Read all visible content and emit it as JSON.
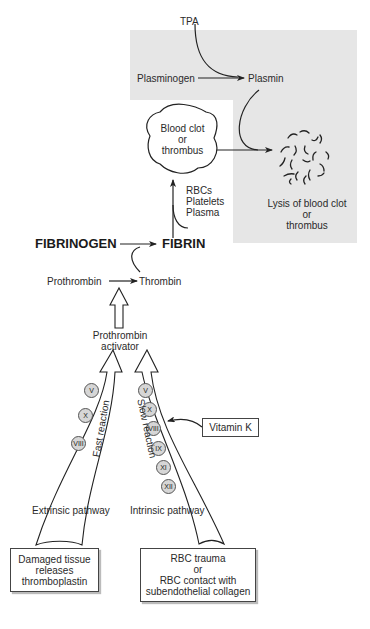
{
  "fibrinolysis": {
    "tpa": "TPA",
    "plasminogen": "Plasminogen",
    "plasmin": "Plasmin",
    "lysis": [
      "Lysis of blood clot",
      "or",
      "thrombus"
    ],
    "background_color": "#e6e6e6"
  },
  "clot": {
    "label": [
      "Blood clot",
      "or",
      "thrombus"
    ],
    "components": [
      "RBCs",
      "Platelets",
      "Plasma"
    ]
  },
  "coagulation": {
    "fibrinogen": "FIBRINOGEN",
    "fibrin": "FIBRIN",
    "prothrombin": "Prothrombin",
    "thrombin": "Thrombin",
    "prothrombin_activator": [
      "Prothrombin",
      "activator"
    ]
  },
  "extrinsic": {
    "reaction_label": "Fast reaction",
    "factors": [
      "V",
      "X",
      "VIII"
    ],
    "pathway_label": "Extrinsic pathway",
    "trigger": [
      "Damaged tissue",
      "releases",
      "thromboplastin"
    ]
  },
  "intrinsic": {
    "reaction_label": "Slow reaction",
    "factors": [
      "V",
      "X",
      "VIII",
      "IX",
      "XI",
      "XII"
    ],
    "pathway_label": "Intrinsic pathway",
    "trigger": [
      "RBC trauma",
      "or",
      "RBC contact with",
      "subendothelial collagen"
    ]
  },
  "cofactor": {
    "label": "Vitamin K"
  }
}
